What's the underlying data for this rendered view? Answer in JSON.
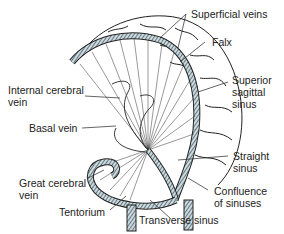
{
  "figure": {
    "colors": {
      "ink": "#222222",
      "sinus_fill": "#c9dbe2",
      "background": "#ffffff"
    }
  },
  "labels": {
    "superficial_veins": "Superficial veins",
    "falx": "Falx",
    "superior_sagittal_sinus": {
      "line1": "Superior",
      "line2": "sagittal",
      "line3": "sinus"
    },
    "internal_cerebral_vein": {
      "line1": "Internal cerebral",
      "line2": "vein"
    },
    "basal_vein": "Basal vein",
    "straight_sinus": {
      "line1": "Straight",
      "line2": "sinus"
    },
    "great_cerebral_vein": {
      "line1": "Great cerebral",
      "line2": "vein"
    },
    "confluence_of_sinuses": {
      "line1": "Confluence",
      "line2": "of sinuses"
    },
    "tentorium": "Tentorium",
    "transverse_sinus": "Transverse sinus"
  }
}
